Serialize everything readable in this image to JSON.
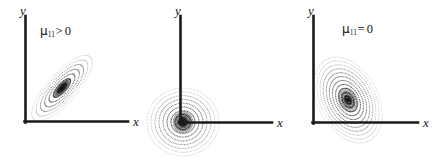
{
  "figure": {
    "background_color": "#ffffff",
    "ink_color": "#141414",
    "panel_count": 3
  },
  "panels": [
    {
      "id": "panel-1",
      "label": {
        "symbol": "μ",
        "subscript": "11",
        "relation": ">",
        "value": "0",
        "text": "μ11> 0"
      },
      "axes": {
        "x_label": "x",
        "y_label": "y"
      },
      "distribution": {
        "shape": "ellipse",
        "correlation": "positive",
        "tilt_degrees": -48,
        "center": [
          62,
          88
        ],
        "semi_major": 42,
        "semi_minor": 15,
        "ring_count": 7,
        "style": "dotted-contours"
      }
    },
    {
      "id": "panel-2",
      "label": {
        "symbol": "μ",
        "subscript": "11",
        "relation": "=",
        "value": "0",
        "text": "μ11= 0"
      },
      "axes": {
        "x_label": "x",
        "y_label": "y"
      },
      "distribution": {
        "shape": "circle",
        "correlation": "zero",
        "tilt_degrees": 0,
        "center": [
          183,
          122
        ],
        "semi_major": 36,
        "semi_minor": 34,
        "ring_count": 9,
        "style": "dotted-contours"
      }
    },
    {
      "id": "panel-3",
      "label": {
        "symbol": "μ",
        "subscript": "11",
        "relation": "<",
        "value": "0",
        "text": "μ11< 0"
      },
      "axes": {
        "x_label": "x",
        "y_label": "y"
      },
      "distribution": {
        "shape": "ellipse",
        "correlation": "negative",
        "tilt_degrees": 62,
        "center": [
          348,
          100
        ],
        "semi_major": 46,
        "semi_minor": 30,
        "ring_count": 11,
        "style": "dotted-contours"
      }
    }
  ],
  "chart_data": {
    "type": "scatter",
    "xlabel": "x",
    "ylabel": "y",
    "grid": false,
    "legend": "none",
    "series": [
      {
        "name": "μ11> 0",
        "correlation_sign": 1,
        "description": "contours tilted up-right"
      },
      {
        "name": "μ11= 0",
        "correlation_sign": 0,
        "description": "circular contours"
      },
      {
        "name": "μ11< 0",
        "correlation_sign": -1,
        "description": "contours tilted down-right"
      }
    ]
  }
}
